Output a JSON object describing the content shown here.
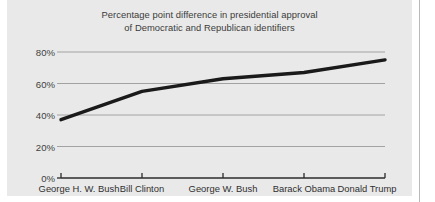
{
  "figure": {
    "background_color": "#ffffff",
    "panel_color": "#e9e9e9",
    "divider_color": "#b9b9b9"
  },
  "chart_data": {
    "type": "line",
    "title": "Percentage point difference in presidential approval of Democratic and Republican identifiers",
    "title_line1": "Percentage point difference in presidential approval",
    "title_line2": "of Democratic and Republican identifiers",
    "xlabel": "",
    "ylabel": "",
    "categories": [
      "George H. W. Bush",
      "Bill Clinton",
      "George W. Bush",
      "Barack Obama",
      "Donald Trump"
    ],
    "values": [
      37,
      55,
      63,
      67,
      75
    ],
    "ylim": [
      0,
      88
    ],
    "yticks": [
      0,
      20,
      40,
      60,
      80
    ],
    "ytick_labels": [
      "0%",
      "20%",
      "40%",
      "60%",
      "80%"
    ],
    "grid": true,
    "grid_color": "#9a9a9a",
    "legend": null,
    "line_color": "#1a1a1a",
    "line_width": 3.4,
    "axis_color": "#2b2b2b"
  }
}
